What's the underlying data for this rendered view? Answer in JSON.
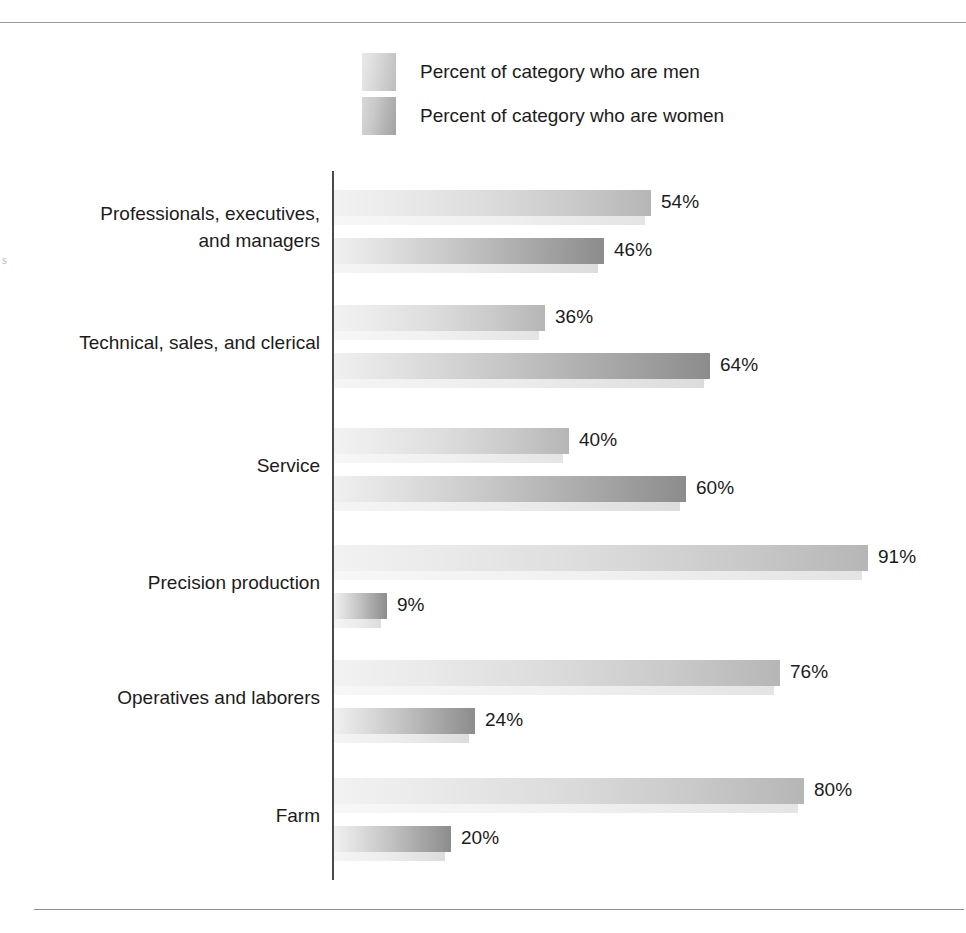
{
  "figure": {
    "rules": {
      "top_label": "top-rule",
      "bottom_label": "bottom-rule"
    },
    "margin_artifact": "s"
  },
  "legend": {
    "position": "top-center",
    "items": [
      {
        "key": "men",
        "label": "Percent of category who are men",
        "swatch": "legend-swatch-men"
      },
      {
        "key": "women",
        "label": "Percent of category who are women",
        "swatch": "legend-swatch-women"
      }
    ]
  },
  "chart_data": {
    "type": "bar",
    "orientation": "horizontal",
    "title": "",
    "subtitle": "",
    "xlabel": "",
    "ylabel": "",
    "xlim": [
      0,
      100
    ],
    "grid": false,
    "legend_position": "top",
    "value_suffix": "%",
    "categories": [
      "Professionals, executives,\nand managers",
      "Technical, sales, and clerical",
      "Service",
      "Precision production",
      "Operatives and laborers",
      "Farm"
    ],
    "series": [
      {
        "name": "Percent of category who are men",
        "values": [
          54,
          36,
          40,
          91,
          76,
          80
        ]
      },
      {
        "name": "Percent of category who are women",
        "values": [
          46,
          64,
          60,
          9,
          24,
          20
        ]
      }
    ],
    "data_labels": [
      [
        "54%",
        "46%"
      ],
      [
        "36%",
        "64%"
      ],
      [
        "40%",
        "60%"
      ],
      [
        "91%",
        "9%"
      ],
      [
        "76%",
        "24%"
      ],
      [
        "80%",
        "20%"
      ]
    ]
  },
  "colors": {
    "men_bar_start": "#f2f2f2",
    "men_bar_end": "#b6b6b6",
    "women_bar_start": "#f0f0f0",
    "women_bar_end": "#8c8c8c",
    "axis": "#4a4a4a",
    "rule": "#9a9a9a",
    "text": "#1c1c1c"
  },
  "layout": {
    "axis_x": 332,
    "axis_top": 171,
    "axis_height": 709,
    "px_per_percent": 5.87,
    "row_tops": [
      190,
      305,
      428,
      545,
      660,
      778
    ],
    "bar_gap": 48
  }
}
